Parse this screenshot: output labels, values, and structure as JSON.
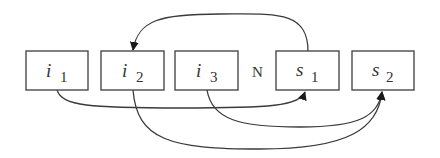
{
  "diagram": {
    "nodes": [
      {
        "id": "i1",
        "label": "i",
        "subscript": "1"
      },
      {
        "id": "i2",
        "label": "i",
        "subscript": "2"
      },
      {
        "id": "i3",
        "label": "i",
        "subscript": "3"
      },
      {
        "id": "s1",
        "label": "s",
        "subscript": "1"
      },
      {
        "id": "s2",
        "label": "s",
        "subscript": "2"
      }
    ],
    "separator": "N",
    "edges": [
      {
        "from": "s1",
        "to": "i2",
        "route": "above"
      },
      {
        "from": "i1",
        "to": "s1",
        "route": "below"
      },
      {
        "from": "i2",
        "to": "s2",
        "route": "below"
      },
      {
        "from": "i3",
        "to": "s2",
        "route": "below"
      }
    ],
    "colors": {
      "stroke": "#3a3a3a",
      "background": "#ffffff"
    }
  }
}
